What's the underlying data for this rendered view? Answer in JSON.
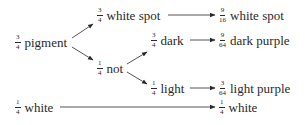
{
  "diagram": {
    "nodes": [
      {
        "id": "pigment",
        "num": "3",
        "den": "4",
        "label": "pigment"
      },
      {
        "id": "white-spot",
        "num": "3",
        "den": "4",
        "label": "white spot"
      },
      {
        "id": "not",
        "num": "1",
        "den": "4",
        "label": "not"
      },
      {
        "id": "dark",
        "num": "3",
        "den": "4",
        "label": "dark"
      },
      {
        "id": "light",
        "num": "1",
        "den": "4",
        "label": "light"
      },
      {
        "id": "white-spot-out",
        "num": "9",
        "den": "16",
        "label": "white spot"
      },
      {
        "id": "dark-purple",
        "num": "9",
        "den": "64",
        "label": "dark purple"
      },
      {
        "id": "light-purple",
        "num": "3",
        "den": "64",
        "label": "light purple"
      },
      {
        "id": "white",
        "num": "1",
        "den": "4",
        "label": "white"
      },
      {
        "id": "white-out",
        "num": "1",
        "den": "4",
        "label": "white"
      }
    ],
    "edges": [
      {
        "from": "pigment",
        "to": "white-spot"
      },
      {
        "from": "pigment",
        "to": "not"
      },
      {
        "from": "white-spot",
        "to": "white-spot-out"
      },
      {
        "from": "not",
        "to": "dark"
      },
      {
        "from": "not",
        "to": "light"
      },
      {
        "from": "dark",
        "to": "dark-purple"
      },
      {
        "from": "light",
        "to": "light-purple"
      },
      {
        "from": "white",
        "to": "white-out"
      }
    ],
    "colors": {
      "ink": "#2a2a2a",
      "background": "#ffffff"
    }
  }
}
